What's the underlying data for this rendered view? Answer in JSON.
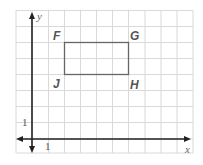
{
  "diagram": {
    "type": "coordinate-grid",
    "grid": {
      "x0": 16,
      "y0": 10,
      "cell": 16.1,
      "cols": 11,
      "rows": 9,
      "color": "#d9d9d9"
    },
    "axes": {
      "origin_px": [
        32,
        139
      ],
      "color": "#222222",
      "x_label": "x",
      "y_label": "y",
      "x_unit_label": "1",
      "y_unit_label": "1"
    },
    "rectangle": {
      "color": "#666666",
      "vertices": [
        {
          "name": "F",
          "coord": [
            2,
            6
          ]
        },
        {
          "name": "G",
          "coord": [
            6,
            6
          ]
        },
        {
          "name": "H",
          "coord": [
            6,
            4
          ]
        },
        {
          "name": "J",
          "coord": [
            2,
            4
          ]
        }
      ]
    },
    "labels": {
      "F": "F",
      "G": "G",
      "H": "H",
      "J": "J"
    }
  }
}
